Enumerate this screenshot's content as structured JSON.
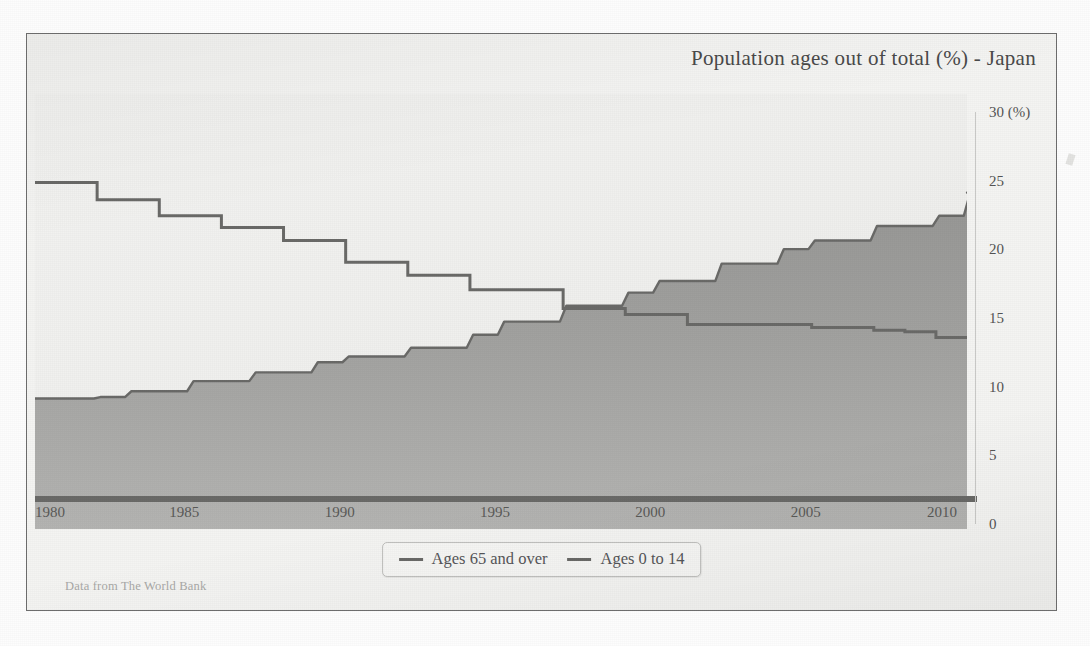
{
  "figure": {
    "title": "Population ages out of total (%) - Japan",
    "source_note": "Data from The World Bank"
  },
  "legend": {
    "position": "bottom-center",
    "items": [
      {
        "label": "Ages 65 and over",
        "color": "#6a6a68"
      },
      {
        "label": "Ages 0 to 14",
        "color": "#6a6a68"
      }
    ]
  },
  "axes": {
    "y": {
      "unit_label": "30 (%)",
      "ticks": [
        {
          "value": 30,
          "label": "30 (%)"
        },
        {
          "value": 25,
          "label": "25"
        },
        {
          "value": 20,
          "label": "20"
        },
        {
          "value": 15,
          "label": "15"
        },
        {
          "value": 10,
          "label": "10"
        },
        {
          "value": 5,
          "label": "5"
        },
        {
          "value": 0,
          "label": "0"
        }
      ]
    },
    "x": {
      "ticks": [
        {
          "value": 1980,
          "label": "1980"
        },
        {
          "value": 1985,
          "label": "1985"
        },
        {
          "value": 1990,
          "label": "1990"
        },
        {
          "value": 1995,
          "label": "1995"
        },
        {
          "value": 2000,
          "label": "2000"
        },
        {
          "value": 2005,
          "label": "2005"
        },
        {
          "value": 2010,
          "label": "2010"
        }
      ]
    }
  },
  "chart_data": {
    "type": "area",
    "title": "Population ages out of total (%) - Japan",
    "subtitle": "",
    "xlabel": "",
    "ylabel": "(%)",
    "xlim": [
      1980,
      2010
    ],
    "ylim": [
      0,
      30
    ],
    "grid": false,
    "legend_position": "bottom-center",
    "annotations": [
      "Data from The World Bank"
    ],
    "step_rendering": "stepped (value held constant across each year)",
    "x": [
      1980,
      1981,
      1982,
      1983,
      1984,
      1985,
      1986,
      1987,
      1988,
      1989,
      1990,
      1991,
      1992,
      1993,
      1994,
      1995,
      1996,
      1997,
      1998,
      1999,
      2000,
      2001,
      2002,
      2003,
      2004,
      2005,
      2006,
      2007,
      2008,
      2009,
      2010
    ],
    "series": [
      {
        "name": "Ages 65 and over",
        "render": "filled-area",
        "fill_color": "#9a9a98",
        "line_color": "#6a6a68",
        "values": [
          9.0,
          9.0,
          9.1,
          9.5,
          9.5,
          10.2,
          10.2,
          10.8,
          10.8,
          11.5,
          11.9,
          11.9,
          12.5,
          12.5,
          13.4,
          14.3,
          14.3,
          15.4,
          15.4,
          16.3,
          17.1,
          17.1,
          18.3,
          18.3,
          19.3,
          19.9,
          19.9,
          20.9,
          20.9,
          21.6,
          23.2
        ]
      },
      {
        "name": "Ages 0 to 14",
        "render": "step-line",
        "line_color": "#6a6a68",
        "values": [
          23.9,
          23.9,
          22.7,
          22.7,
          21.6,
          21.6,
          20.8,
          20.8,
          19.9,
          19.9,
          18.4,
          18.4,
          17.5,
          17.5,
          16.5,
          16.5,
          16.5,
          15.2,
          15.2,
          14.8,
          14.8,
          14.1,
          14.1,
          14.1,
          14.1,
          13.9,
          13.9,
          13.7,
          13.6,
          13.2,
          13.2
        ]
      }
    ]
  }
}
